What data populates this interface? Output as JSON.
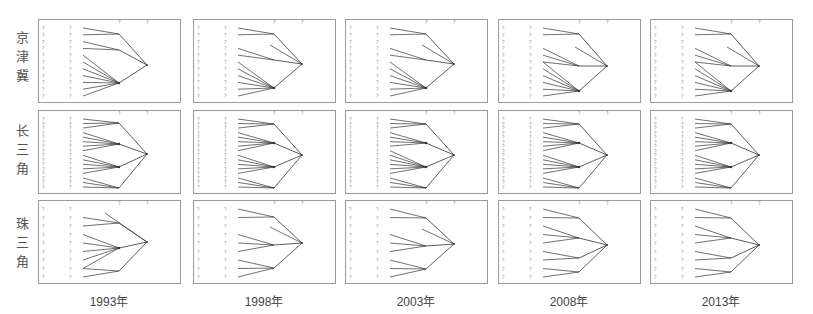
{
  "figure": {
    "row_labels": [
      {
        "key": "jjj",
        "chars": [
          "京",
          "津",
          "冀"
        ]
      },
      {
        "key": "csj",
        "chars": [
          "长",
          "三",
          "角"
        ]
      },
      {
        "key": "zsj",
        "chars": [
          "珠",
          "三",
          "角"
        ]
      }
    ],
    "column_labels": [
      "1993年",
      "1998年",
      "2003年",
      "2008年",
      "2013年"
    ],
    "marker_glyph": "?",
    "colors": {
      "border": "#9a9a9a",
      "line": "#333333",
      "marker": "#888888",
      "label": "#555555"
    }
  },
  "layout": {
    "panel_lefts": [
      38,
      193,
      345,
      498,
      650
    ],
    "panel_tops": [
      19,
      110,
      200
    ],
    "panel_width": 143,
    "panel_height": 84
  },
  "panels": [
    [
      {
        "year": "1993年",
        "region": "京津冀",
        "left_markers": 11,
        "leaf_markers": 11,
        "groups": [
          [
            0,
            1
          ],
          [
            2,
            3
          ],
          [
            4,
            5,
            6,
            7,
            8,
            9,
            10
          ]
        ],
        "group_y": [
          14,
          30,
          63
        ],
        "root_y": 45,
        "stray": []
      },
      {
        "year": "1998年",
        "region": "京津冀",
        "left_markers": 11,
        "leaf_markers": 11,
        "groups": [
          [
            0,
            1
          ],
          [
            3,
            4
          ],
          [
            5,
            6,
            7,
            8,
            9,
            10
          ]
        ],
        "group_y": [
          14,
          40,
          68
        ],
        "root_y": 44,
        "stray": [
          [
            32,
            25
          ]
        ]
      },
      {
        "year": "2003年",
        "region": "京津冀",
        "left_markers": 11,
        "leaf_markers": 11,
        "groups": [
          [
            0,
            1
          ],
          [
            3,
            4
          ],
          [
            5,
            6,
            7,
            8,
            9,
            10
          ]
        ],
        "group_y": [
          14,
          40,
          68
        ],
        "root_y": 44,
        "stray": [
          [
            32,
            25
          ]
        ]
      },
      {
        "year": "2008年",
        "region": "京津冀",
        "left_markers": 11,
        "leaf_markers": 11,
        "groups": [
          [
            0,
            1
          ],
          [
            3,
            4,
            5
          ],
          [
            5,
            6,
            7,
            8,
            9,
            10
          ]
        ],
        "group_y": [
          14,
          46,
          71
        ],
        "root_y": 46,
        "stray": [
          [
            32,
            27
          ]
        ]
      },
      {
        "year": "2013年",
        "region": "京津冀",
        "left_markers": 11,
        "leaf_markers": 11,
        "groups": [
          [
            0,
            1
          ],
          [
            3,
            4,
            5
          ],
          [
            5,
            6,
            7,
            8,
            9,
            10
          ]
        ],
        "group_y": [
          14,
          46,
          71
        ],
        "root_y": 46,
        "stray": [
          [
            32,
            27
          ]
        ]
      }
    ],
    [
      {
        "year": "1993年",
        "region": "长三角",
        "left_markers": 16,
        "leaf_markers": 16,
        "groups": [
          [
            0,
            1,
            2
          ],
          [
            3,
            4,
            5,
            6,
            7
          ],
          [
            8,
            9,
            10,
            11,
            12
          ],
          [
            13,
            14,
            15
          ]
        ],
        "group_y": [
          12,
          33,
          56,
          77
        ],
        "root_y": 43,
        "stray": []
      },
      {
        "year": "1998年",
        "region": "长三角",
        "left_markers": 16,
        "leaf_markers": 16,
        "groups": [
          [
            0,
            1,
            2
          ],
          [
            3,
            4,
            5,
            6,
            7
          ],
          [
            8,
            9,
            10,
            11,
            12
          ],
          [
            13,
            14,
            15
          ]
        ],
        "group_y": [
          13,
          32,
          56,
          77
        ],
        "root_y": 44,
        "stray": []
      },
      {
        "year": "2003年",
        "region": "长三角",
        "left_markers": 16,
        "leaf_markers": 16,
        "groups": [
          [
            0,
            1,
            2
          ],
          [
            3,
            4,
            5,
            6
          ],
          [
            7,
            8,
            9,
            10,
            11,
            12
          ],
          [
            13,
            14,
            15
          ]
        ],
        "group_y": [
          13,
          32,
          56,
          77
        ],
        "root_y": 44,
        "stray": []
      },
      {
        "year": "2008年",
        "region": "长三角",
        "left_markers": 16,
        "leaf_markers": 16,
        "groups": [
          [
            0,
            1,
            2
          ],
          [
            3,
            4,
            5,
            6,
            7
          ],
          [
            8,
            9,
            10,
            11,
            12
          ],
          [
            13,
            14,
            15
          ]
        ],
        "group_y": [
          13,
          32,
          56,
          77
        ],
        "root_y": 44,
        "stray": []
      },
      {
        "year": "2013年",
        "region": "长三角",
        "left_markers": 16,
        "leaf_markers": 16,
        "groups": [
          [
            0,
            1,
            2
          ],
          [
            3,
            4,
            5,
            6,
            7
          ],
          [
            8,
            9,
            10,
            11,
            12
          ],
          [
            13,
            14,
            15
          ]
        ],
        "group_y": [
          13,
          32,
          56,
          77
        ],
        "root_y": 44,
        "stray": []
      }
    ],
    [
      {
        "year": "1993年",
        "region": "珠三角",
        "left_markers": 9,
        "leaf_markers": 9,
        "groups": [
          [
            1,
            2
          ],
          [
            3,
            4,
            5,
            6,
            7
          ],
          [
            7,
            8
          ]
        ],
        "group_y": [
          22,
          47,
          70
        ],
        "root_y": 41,
        "stray": [
          [
            80,
            12
          ]
        ]
      },
      {
        "year": "1998年",
        "region": "珠三角",
        "left_markers": 9,
        "leaf_markers": 9,
        "groups": [
          [
            0,
            1
          ],
          [
            3,
            4,
            5
          ],
          [
            6,
            7,
            8
          ]
        ],
        "group_y": [
          16,
          44,
          67
        ],
        "root_y": 42,
        "stray": [
          [
            32,
            26
          ]
        ]
      },
      {
        "year": "2003年",
        "region": "珠三角",
        "left_markers": 9,
        "leaf_markers": 9,
        "groups": [
          [
            0,
            1
          ],
          [
            3,
            4,
            5
          ],
          [
            6,
            7,
            8
          ]
        ],
        "group_y": [
          17,
          45,
          68
        ],
        "root_y": 43,
        "stray": [
          [
            32,
            28
          ]
        ]
      },
      {
        "year": "2008年",
        "region": "珠三角",
        "left_markers": 9,
        "leaf_markers": 9,
        "groups": [
          [
            0,
            1
          ],
          [
            2,
            3,
            4
          ],
          [
            5,
            6
          ],
          [
            7,
            8
          ]
        ],
        "group_y": [
          17,
          37,
          57,
          71
        ],
        "root_y": 44,
        "stray": []
      },
      {
        "year": "2013年",
        "region": "珠三角",
        "left_markers": 9,
        "leaf_markers": 9,
        "groups": [
          [
            0,
            1
          ],
          [
            2,
            3,
            4
          ],
          [
            5,
            6
          ],
          [
            7,
            8
          ]
        ],
        "group_y": [
          17,
          37,
          57,
          71
        ],
        "root_y": 44,
        "stray": []
      }
    ]
  ]
}
